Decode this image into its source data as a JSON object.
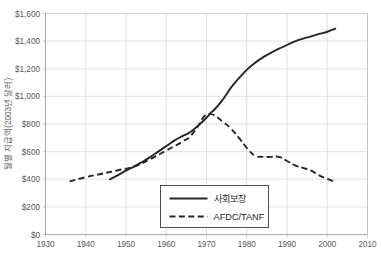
{
  "chart_data": {
    "type": "line",
    "title": "",
    "subtitle": "",
    "xlabel": "",
    "ylabel": "월별 지급액(2003년 달러)",
    "xlim": [
      1930,
      2010
    ],
    "ylim": [
      0,
      1600
    ],
    "grid": true,
    "grid_axes": "both",
    "legend_position": "inside-bottom-center",
    "x_tick_labels": [
      "1930",
      "1940",
      "1950",
      "1960",
      "1970",
      "1980",
      "1990",
      "2000",
      "2010"
    ],
    "x_tick_values": [
      1930,
      1940,
      1950,
      1960,
      1970,
      1980,
      1990,
      2000,
      2010
    ],
    "y_tick_labels": [
      "$0",
      "$200",
      "$400",
      "$600",
      "$800",
      "$1,000",
      "$1,200",
      "$1,400",
      "$1,600"
    ],
    "y_tick_values": [
      0,
      200,
      400,
      600,
      800,
      1000,
      1200,
      1400,
      1600
    ],
    "series": [
      {
        "name": "사회보장",
        "style": "solid",
        "color": "#262626",
        "points": [
          [
            1946,
            400
          ],
          [
            1948,
            430
          ],
          [
            1950,
            462
          ],
          [
            1952,
            492
          ],
          [
            1954,
            525
          ],
          [
            1956,
            560
          ],
          [
            1958,
            600
          ],
          [
            1960,
            640
          ],
          [
            1962,
            680
          ],
          [
            1964,
            712
          ],
          [
            1966,
            742
          ],
          [
            1968,
            790
          ],
          [
            1970,
            845
          ],
          [
            1971,
            880
          ],
          [
            1972,
            905
          ],
          [
            1974,
            975
          ],
          [
            1976,
            1060
          ],
          [
            1978,
            1130
          ],
          [
            1980,
            1192
          ],
          [
            1982,
            1242
          ],
          [
            1984,
            1282
          ],
          [
            1986,
            1315
          ],
          [
            1988,
            1345
          ],
          [
            1990,
            1372
          ],
          [
            1992,
            1398
          ],
          [
            1994,
            1418
          ],
          [
            1996,
            1435
          ],
          [
            1998,
            1452
          ],
          [
            2000,
            1468
          ],
          [
            2002,
            1490
          ]
        ]
      },
      {
        "name": "AFDC/TANF",
        "style": "dashed",
        "color": "#262626",
        "points": [
          [
            1936,
            385
          ],
          [
            1940,
            415
          ],
          [
            1944,
            440
          ],
          [
            1948,
            465
          ],
          [
            1952,
            492
          ],
          [
            1956,
            545
          ],
          [
            1960,
            608
          ],
          [
            1964,
            672
          ],
          [
            1966,
            712
          ],
          [
            1968,
            790
          ],
          [
            1969,
            840
          ],
          [
            1970,
            868
          ],
          [
            1971,
            872
          ],
          [
            1972,
            862
          ],
          [
            1974,
            818
          ],
          [
            1976,
            768
          ],
          [
            1978,
            702
          ],
          [
            1980,
            628
          ],
          [
            1982,
            572
          ],
          [
            1984,
            562
          ],
          [
            1986,
            562
          ],
          [
            1988,
            562
          ],
          [
            1990,
            532
          ],
          [
            1992,
            500
          ],
          [
            1994,
            482
          ],
          [
            1996,
            462
          ],
          [
            1998,
            428
          ],
          [
            2000,
            402
          ],
          [
            2002,
            380
          ]
        ]
      }
    ]
  },
  "legend": {
    "items": [
      {
        "label": "사회보장",
        "style": "solid"
      },
      {
        "label": "AFDC/TANF",
        "style": "dashed"
      }
    ]
  }
}
